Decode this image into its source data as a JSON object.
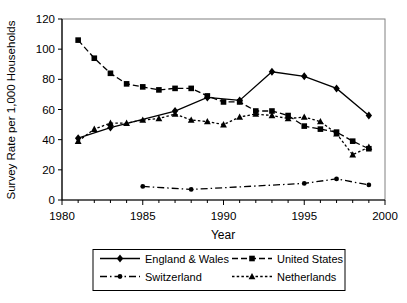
{
  "chart_data": {
    "type": "line",
    "title": "",
    "xlabel": "Year",
    "ylabel": "Survey Rate per 1,000 Households",
    "xlim": [
      1980,
      2000
    ],
    "ylim": [
      0,
      120
    ],
    "x_ticks": [
      1980,
      1985,
      1990,
      1995,
      2000
    ],
    "y_ticks": [
      0,
      20,
      40,
      60,
      80,
      100,
      120
    ],
    "grid": false,
    "legend_position": "bottom",
    "background": "#ffffff",
    "axis_color": "#000000",
    "plot_border_color": "#808080",
    "series": [
      {
        "name": "England & Wales",
        "marker": "diamond",
        "line_style": "solid",
        "color": "#000000",
        "points": [
          [
            1981,
            41
          ],
          [
            1983,
            48
          ],
          [
            1987,
            59
          ],
          [
            1989,
            68
          ],
          [
            1991,
            66
          ],
          [
            1993,
            85
          ],
          [
            1995,
            82
          ],
          [
            1997,
            74
          ],
          [
            1999,
            56
          ]
        ]
      },
      {
        "name": "United States",
        "marker": "square",
        "line_style": "dashed",
        "color": "#000000",
        "points": [
          [
            1981,
            106
          ],
          [
            1982,
            94
          ],
          [
            1983,
            84
          ],
          [
            1984,
            77
          ],
          [
            1985,
            75
          ],
          [
            1986,
            73
          ],
          [
            1987,
            74
          ],
          [
            1988,
            74
          ],
          [
            1989,
            69
          ],
          [
            1990,
            65
          ],
          [
            1991,
            65
          ],
          [
            1992,
            59
          ],
          [
            1993,
            59
          ],
          [
            1994,
            56
          ],
          [
            1995,
            49
          ],
          [
            1996,
            47
          ],
          [
            1997,
            45
          ],
          [
            1998,
            39
          ],
          [
            1999,
            34
          ]
        ]
      },
      {
        "name": "Switzerland",
        "marker": "circle",
        "line_style": "dash-dot",
        "color": "#000000",
        "points": [
          [
            1985,
            9
          ],
          [
            1988,
            7
          ],
          [
            1995,
            11
          ],
          [
            1997,
            14
          ],
          [
            1999,
            10
          ]
        ]
      },
      {
        "name": "Netherlands",
        "marker": "triangle",
        "line_style": "dotted",
        "color": "#000000",
        "points": [
          [
            1981,
            39
          ],
          [
            1982,
            47
          ],
          [
            1983,
            51
          ],
          [
            1984,
            51
          ],
          [
            1985,
            53
          ],
          [
            1986,
            54
          ],
          [
            1987,
            57
          ],
          [
            1988,
            53
          ],
          [
            1989,
            52
          ],
          [
            1990,
            50
          ],
          [
            1991,
            55
          ],
          [
            1992,
            57
          ],
          [
            1993,
            56
          ],
          [
            1994,
            54
          ],
          [
            1995,
            55
          ],
          [
            1996,
            52
          ],
          [
            1997,
            44
          ],
          [
            1998,
            30
          ],
          [
            1999,
            35
          ]
        ]
      }
    ]
  }
}
